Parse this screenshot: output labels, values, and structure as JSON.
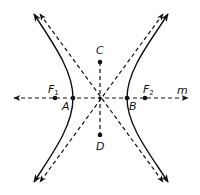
{
  "diagram": {
    "type": "hyperbola",
    "colors": {
      "stroke": "#111111",
      "background": "#ffffff"
    },
    "labels": {
      "F1": {
        "main": "F",
        "sub": "1"
      },
      "F2": {
        "main": "F",
        "sub": "2"
      },
      "A": "A",
      "B": "B",
      "C": "C",
      "D": "D",
      "m": "m"
    },
    "points": {
      "F1": [
        55,
        98
      ],
      "A": [
        73,
        98
      ],
      "center": [
        100,
        98
      ],
      "B": [
        127,
        98
      ],
      "F2": [
        145,
        98
      ],
      "C": [
        100,
        62
      ],
      "D": [
        100,
        135
      ]
    },
    "lines": {
      "axis_m": {
        "style": "dashed",
        "arrows": "both"
      },
      "conjugate_axis_CD": {
        "style": "dashed",
        "arrows": "none"
      },
      "asymptotes": {
        "style": "dashed",
        "arrows": "both",
        "count": 2
      },
      "branches": {
        "style": "solid",
        "arrows": "both",
        "count": 2
      }
    }
  }
}
